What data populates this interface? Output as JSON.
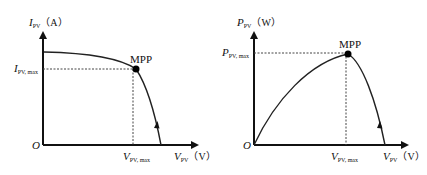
{
  "left_panel": {
    "y_axis": {
      "symbol": "I",
      "subscript": "PV",
      "unit": "（A）"
    },
    "x_axis": {
      "symbol": "V",
      "subscript": "PV",
      "unit": "（V）"
    },
    "origin": "O",
    "mpp_label": "MPP",
    "y_marker": {
      "symbol": "I",
      "subscript": "PV, max"
    },
    "x_marker": {
      "symbol": "V",
      "subscript": "PV, max"
    },
    "curve": "I-V characteristic"
  },
  "right_panel": {
    "y_axis": {
      "symbol": "P",
      "subscript": "PV",
      "unit": "（W）"
    },
    "x_axis": {
      "symbol": "V",
      "subscript": "PV",
      "unit": "（V）"
    },
    "origin": "O",
    "mpp_label": "MPP",
    "y_marker": {
      "symbol": "P",
      "subscript": "PV, max"
    },
    "x_marker": {
      "symbol": "V",
      "subscript": "PV, max"
    },
    "curve": "P-V characteristic"
  },
  "colors": {
    "line": "#222222",
    "background": "#ffffff"
  }
}
